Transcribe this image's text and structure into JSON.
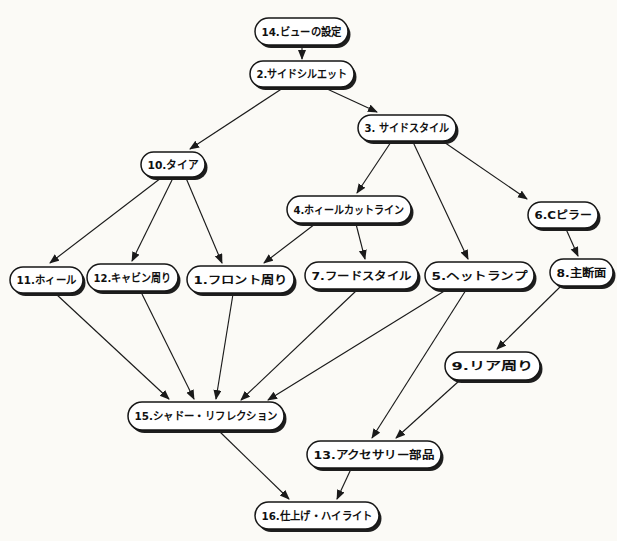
{
  "figure": {
    "background": "#fbfaf6",
    "node_style": {
      "fill": "#ffffff",
      "stroke": "#161616",
      "stroke_width": 1.5,
      "shadow_color": "#1e1e1e",
      "shadow_dx": 2.5,
      "shadow_dy": 3,
      "text_color": "#101010"
    },
    "edge_style": {
      "color": "#1a1a1a",
      "stroke_width": 1.15
    },
    "nodes": [
      {
        "id": "14",
        "label": "14.ビューの設定",
        "x": 255,
        "y": 18,
        "w": 93,
        "h": 27
      },
      {
        "id": "2",
        "label": "2.サイドシルエット",
        "x": 250,
        "y": 61,
        "w": 104,
        "h": 26
      },
      {
        "id": "3",
        "label": "3. サイドスタイル",
        "x": 358,
        "y": 115,
        "w": 98,
        "h": 26
      },
      {
        "id": "10",
        "label": "10.タイア",
        "x": 141,
        "y": 152,
        "w": 64,
        "h": 25
      },
      {
        "id": "4",
        "label": "4.ホィールカットライン",
        "x": 287,
        "y": 196,
        "w": 124,
        "h": 27
      },
      {
        "id": "6",
        "label": "6.Cピラー",
        "x": 528,
        "y": 202,
        "w": 70,
        "h": 26
      },
      {
        "id": "11",
        "label": "11.ホィール",
        "x": 10,
        "y": 267,
        "w": 73,
        "h": 26
      },
      {
        "id": "12",
        "label": "12.キャビン周り",
        "x": 87,
        "y": 264,
        "w": 91,
        "h": 27
      },
      {
        "id": "1",
        "label": "1.フロント周り",
        "x": 187,
        "y": 266,
        "w": 107,
        "h": 27
      },
      {
        "id": "7",
        "label": "7.フードスタイル",
        "x": 305,
        "y": 262,
        "w": 113,
        "h": 27
      },
      {
        "id": "5",
        "label": "5.ヘットランプ",
        "x": 425,
        "y": 262,
        "w": 109,
        "h": 27
      },
      {
        "id": "8",
        "label": "8.主断面",
        "x": 550,
        "y": 259,
        "w": 63,
        "h": 27
      },
      {
        "id": "9",
        "label": "9.リア周り",
        "x": 445,
        "y": 352,
        "w": 95,
        "h": 28
      },
      {
        "id": "15",
        "label": "15.シャドー・リフレクション",
        "x": 128,
        "y": 402,
        "w": 156,
        "h": 28
      },
      {
        "id": "13",
        "label": "13.アクセサリー部品",
        "x": 307,
        "y": 441,
        "w": 134,
        "h": 27
      },
      {
        "id": "16",
        "label": "16.仕上げ・ハイライト",
        "x": 255,
        "y": 502,
        "w": 124,
        "h": 27
      }
    ],
    "edges": [
      {
        "from": "14",
        "to": "2",
        "x1": 302,
        "y1": 46,
        "x2": 302,
        "y2": 59
      },
      {
        "from": "2",
        "to": "10",
        "x1": 283,
        "y1": 88,
        "x2": 190,
        "y2": 149
      },
      {
        "from": "2",
        "to": "3",
        "x1": 325,
        "y1": 88,
        "x2": 377,
        "y2": 112
      },
      {
        "from": "3",
        "to": "4",
        "x1": 391,
        "y1": 142,
        "x2": 357,
        "y2": 193
      },
      {
        "from": "3",
        "to": "5",
        "x1": 413,
        "y1": 142,
        "x2": 468,
        "y2": 259
      },
      {
        "from": "3",
        "to": "6",
        "x1": 441,
        "y1": 140,
        "x2": 527,
        "y2": 199
      },
      {
        "from": "10",
        "to": "11",
        "x1": 161,
        "y1": 178,
        "x2": 50,
        "y2": 263
      },
      {
        "from": "10",
        "to": "12",
        "x1": 173,
        "y1": 178,
        "x2": 132,
        "y2": 261
      },
      {
        "from": "10",
        "to": "1",
        "x1": 186,
        "y1": 178,
        "x2": 222,
        "y2": 263
      },
      {
        "from": "4",
        "to": "1",
        "x1": 315,
        "y1": 224,
        "x2": 264,
        "y2": 263
      },
      {
        "from": "4",
        "to": "7",
        "x1": 356,
        "y1": 224,
        "x2": 365,
        "y2": 259
      },
      {
        "from": "6",
        "to": "8",
        "x1": 566,
        "y1": 229,
        "x2": 578,
        "y2": 256
      },
      {
        "from": "8",
        "to": "9",
        "x1": 560,
        "y1": 287,
        "x2": 497,
        "y2": 349
      },
      {
        "from": "11",
        "to": "15",
        "x1": 56,
        "y1": 294,
        "x2": 169,
        "y2": 399
      },
      {
        "from": "12",
        "to": "15",
        "x1": 141,
        "y1": 292,
        "x2": 194,
        "y2": 399
      },
      {
        "from": "1",
        "to": "15",
        "x1": 233,
        "y1": 294,
        "x2": 216,
        "y2": 399
      },
      {
        "from": "7",
        "to": "15",
        "x1": 357,
        "y1": 290,
        "x2": 241,
        "y2": 400
      },
      {
        "from": "5",
        "to": "15",
        "x1": 446,
        "y1": 290,
        "x2": 268,
        "y2": 400
      },
      {
        "from": "5",
        "to": "13",
        "x1": 466,
        "y1": 290,
        "x2": 372,
        "y2": 438
      },
      {
        "from": "9",
        "to": "13",
        "x1": 459,
        "y1": 381,
        "x2": 396,
        "y2": 438
      },
      {
        "from": "15",
        "to": "16",
        "x1": 219,
        "y1": 431,
        "x2": 289,
        "y2": 499
      },
      {
        "from": "13",
        "to": "16",
        "x1": 351,
        "y1": 469,
        "x2": 337,
        "y2": 499
      }
    ]
  }
}
